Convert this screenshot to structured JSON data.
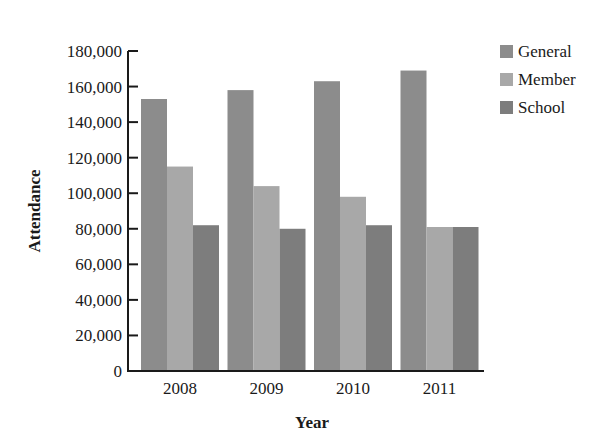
{
  "chart_data": {
    "type": "bar",
    "title": "",
    "xlabel": "Year",
    "ylabel": "Attendance",
    "categories": [
      "2008",
      "2009",
      "2010",
      "2011"
    ],
    "series": [
      {
        "name": "General",
        "color": "#8c8c8c",
        "values": [
          153000,
          158000,
          163000,
          169000
        ]
      },
      {
        "name": "Member",
        "color": "#a8a8a8",
        "values": [
          115000,
          104000,
          98000,
          81000
        ]
      },
      {
        "name": "School",
        "color": "#7d7d7d",
        "values": [
          82000,
          80000,
          82000,
          81000
        ]
      }
    ],
    "ylim": [
      0,
      180000
    ],
    "yticks": [
      0,
      20000,
      40000,
      60000,
      80000,
      100000,
      120000,
      140000,
      160000,
      180000
    ],
    "ytick_labels": [
      "0",
      "20,000",
      "40,000",
      "60,000",
      "80,000",
      "100,000",
      "120,000",
      "140,000",
      "160,000",
      "180,000"
    ],
    "grid": false,
    "legend_position": "upper right, outside plot"
  }
}
